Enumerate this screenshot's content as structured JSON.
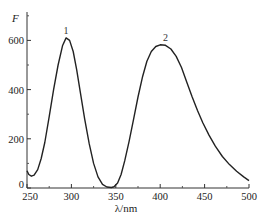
{
  "chart_data": {
    "type": "line",
    "title": "",
    "xlabel": "λ/nm",
    "ylabel": "F",
    "xlim": [
      250,
      500
    ],
    "ylim": [
      0,
      700
    ],
    "x_ticks": [
      250,
      300,
      350,
      400,
      450,
      500
    ],
    "x_tick_labels": [
      "250",
      "300",
      "350",
      "400",
      "450",
      "500"
    ],
    "y_ticks": [
      0,
      200,
      400,
      600
    ],
    "y_tick_labels": [
      "0",
      "200",
      "400",
      "600"
    ],
    "grid": false,
    "legend": null,
    "annotations": [
      {
        "text": "1",
        "x": 294,
        "y": 610
      },
      {
        "text": "2",
        "x": 406,
        "y": 580
      }
    ],
    "series": [
      {
        "name": "fluorescence",
        "color": "#222222",
        "x": [
          250,
          252,
          255,
          258,
          262,
          266,
          270,
          275,
          280,
          285,
          290,
          294,
          298,
          302,
          306,
          310,
          315,
          320,
          325,
          330,
          335,
          340,
          345,
          348,
          352,
          356,
          360,
          365,
          370,
          375,
          380,
          385,
          390,
          395,
          400,
          406,
          412,
          418,
          424,
          430,
          436,
          442,
          448,
          455,
          462,
          470,
          478,
          486,
          494,
          500
        ],
        "y": [
          70,
          55,
          48,
          52,
          75,
          120,
          185,
          290,
          400,
          500,
          578,
          610,
          600,
          555,
          480,
          390,
          280,
          180,
          100,
          45,
          15,
          4,
          2,
          5,
          20,
          55,
          110,
          190,
          280,
          370,
          450,
          515,
          555,
          575,
          582,
          580,
          565,
          535,
          490,
          430,
          370,
          315,
          265,
          215,
          170,
          128,
          95,
          68,
          45,
          30
        ]
      }
    ]
  }
}
